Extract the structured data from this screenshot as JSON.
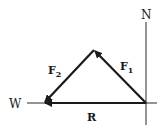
{
  "diagram": {
    "type": "vector-addition",
    "labels": {
      "north": "N",
      "west": "W",
      "f1": "F",
      "f1_sub": "1",
      "f2": "F",
      "f2_sub": "2",
      "resultant": "R"
    },
    "points": {
      "origin": [
        146,
        103
      ],
      "apex": [
        94,
        50
      ],
      "tip": [
        44,
        103
      ]
    },
    "vectors": [
      {
        "name": "F1",
        "from": "origin",
        "to": "apex"
      },
      {
        "name": "F2",
        "from": "apex",
        "to": "tip"
      },
      {
        "name": "R",
        "from": "origin",
        "to": "tip"
      }
    ],
    "colors": {
      "stroke": "#1a1a1a",
      "axis": "#2a2a2a",
      "background": "#ffffff"
    }
  }
}
